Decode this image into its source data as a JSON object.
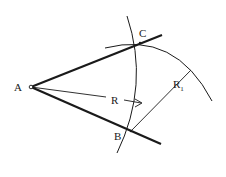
{
  "diagram": {
    "type": "geometric-construction",
    "points": [
      {
        "id": "A",
        "label": "A",
        "x": 31,
        "y": 87
      },
      {
        "id": "B",
        "label": "B",
        "x": 131,
        "y": 131
      },
      {
        "id": "C",
        "label": "C",
        "x": 140,
        "y": 43
      }
    ],
    "segments": [
      {
        "id": "ray-AC",
        "from": "A",
        "to_xy": [
          162,
          35
        ],
        "weight": "bold"
      },
      {
        "id": "ray-AB",
        "from": "A",
        "to_xy": [
          161,
          144
        ],
        "weight": "bold"
      },
      {
        "id": "radius-R",
        "from": "A",
        "to_xy": [
          142,
          103
        ],
        "label": "R"
      },
      {
        "id": "radius-R1",
        "from": "B",
        "to_xy": [
          192,
          69
        ],
        "label": "R1"
      }
    ],
    "arcs": [
      {
        "id": "arc-R",
        "center": "A",
        "radius_label": "R",
        "passes_through": [
          "B",
          "C"
        ]
      },
      {
        "id": "arc-R1",
        "center": "B",
        "radius_label": "R1",
        "passes_through": [
          "C"
        ]
      }
    ],
    "labels": {
      "A": "A",
      "B": "B",
      "C": "C",
      "R": "R",
      "R1_main": "R",
      "R1_sub": "1"
    },
    "colors": {
      "stroke": "#1a1a1a",
      "background": "#ffffff"
    }
  }
}
